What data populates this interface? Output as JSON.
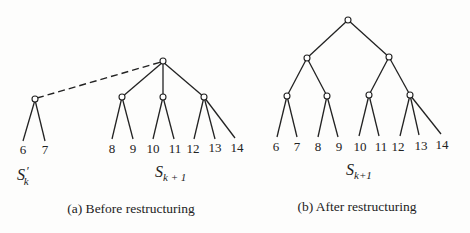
{
  "panels": [
    {
      "id": "a",
      "caption": "(a) Before restructuring",
      "sets": [
        {
          "symbol": "S",
          "prime": "′",
          "subscript": "k"
        },
        {
          "symbol": "S",
          "prime": "",
          "subscript": "k + 1"
        }
      ],
      "dashed_edge": {
        "from": "root_a",
        "to": "sk_prime_root"
      },
      "leaves": [
        "6",
        "7",
        "8",
        "9",
        "10",
        "11",
        "12",
        "13",
        "14"
      ]
    },
    {
      "id": "b",
      "caption": "(b) After restructuring",
      "sets": [
        {
          "symbol": "S",
          "prime": "",
          "subscript": "k+1"
        }
      ],
      "leaves": [
        "6",
        "7",
        "8",
        "9",
        "10",
        "11",
        "12",
        "13",
        "14"
      ]
    }
  ]
}
